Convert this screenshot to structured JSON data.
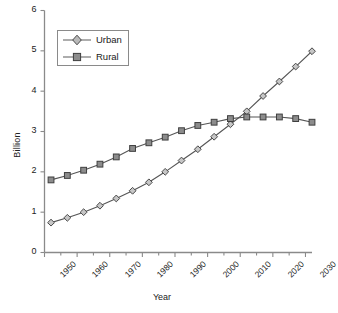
{
  "chart_data": {
    "type": "line",
    "title": "",
    "xlabel": "Year",
    "ylabel": "Billion",
    "xlim": [
      1950,
      2032
    ],
    "ylim": [
      0,
      6
    ],
    "ytick_values": [
      0,
      1,
      2,
      3,
      4,
      5,
      6
    ],
    "ytick_labels": [
      "0",
      "1",
      "2",
      "3",
      "4",
      "5",
      "6"
    ],
    "xtick_values": [
      1950,
      1960,
      1970,
      1980,
      1990,
      2000,
      2010,
      2020,
      2030
    ],
    "xtick_labels": [
      "1950",
      "1960",
      "1970",
      "1980",
      "1990",
      "2000",
      "2010",
      "2020",
      "2030"
    ],
    "xminor_step": 5,
    "grid": false,
    "legend_position": "upper-left",
    "x": [
      1952,
      1957,
      1962,
      1967,
      1972,
      1977,
      1982,
      1987,
      1992,
      1997,
      2002,
      2007,
      2012,
      2017,
      2022,
      2027,
      2032
    ],
    "series": [
      {
        "name": "Urban",
        "marker": "open-diamond",
        "color": "#6b6b6b",
        "values": [
          0.74,
          0.86,
          1.0,
          1.16,
          1.34,
          1.53,
          1.74,
          2.0,
          2.28,
          2.56,
          2.87,
          3.18,
          3.5,
          3.88,
          4.24,
          4.61,
          4.99
        ]
      },
      {
        "name": "Rural",
        "marker": "filled-square",
        "color": "#6b6b6b",
        "values": [
          1.8,
          1.91,
          2.04,
          2.19,
          2.37,
          2.58,
          2.72,
          2.86,
          3.02,
          3.15,
          3.23,
          3.32,
          3.36,
          3.36,
          3.36,
          3.32,
          3.23
        ]
      }
    ]
  },
  "legend": {
    "items": [
      {
        "label": "Urban"
      },
      {
        "label": "Rural"
      }
    ]
  },
  "axes": {
    "y_title": "Billion",
    "x_title": "Year"
  },
  "colors": {
    "axis": "#8a8a8a",
    "line": "#555555",
    "marker_fill": "#9a9a9a",
    "marker_edge": "#4a4a4a",
    "text": "#222222"
  }
}
